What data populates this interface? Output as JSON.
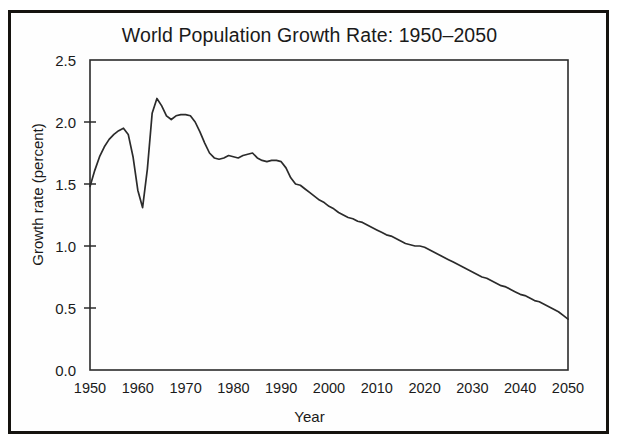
{
  "figure": {
    "title": "World Population Growth Rate: 1950–2050",
    "x_axis_title": "Year",
    "y_axis_title": "Growth rate (percent)",
    "frame_color": "#15130f",
    "line_color": "#2b2b2b",
    "background_color": "#ffffff"
  },
  "chart_data": {
    "type": "line",
    "title": "World Population Growth Rate: 1950–2050",
    "xlabel": "Year",
    "ylabel": "Growth rate (percent)",
    "xlim": [
      1950,
      2050
    ],
    "ylim": [
      0.0,
      2.5
    ],
    "grid": false,
    "legend": "none",
    "xticks": [
      1950,
      1960,
      1970,
      1980,
      1990,
      2000,
      2010,
      2020,
      2030,
      2040,
      2050
    ],
    "xtick_labels": [
      "1950",
      "1960",
      "1970",
      "1980",
      "1990",
      "2000",
      "2010",
      "2020",
      "2030",
      "2040",
      "2050"
    ],
    "yticks": [
      0.0,
      0.5,
      1.0,
      1.5,
      2.0,
      2.5
    ],
    "ytick_labels": [
      "0.0",
      "0.5",
      "1.0",
      "1.5",
      "2.0",
      "2.5"
    ],
    "series": [
      {
        "name": "World population growth rate",
        "x": [
          1950,
          1951,
          1952,
          1953,
          1954,
          1955,
          1956,
          1957,
          1958,
          1959,
          1960,
          1961,
          1962,
          1963,
          1964,
          1965,
          1966,
          1967,
          1968,
          1969,
          1970,
          1971,
          1972,
          1973,
          1974,
          1975,
          1976,
          1977,
          1978,
          1979,
          1980,
          1981,
          1982,
          1983,
          1984,
          1985,
          1986,
          1987,
          1988,
          1989,
          1990,
          1991,
          1992,
          1993,
          1994,
          1995,
          1996,
          1997,
          1998,
          1999,
          2000,
          2001,
          2002,
          2003,
          2004,
          2005,
          2006,
          2007,
          2008,
          2009,
          2010,
          2011,
          2012,
          2013,
          2014,
          2015,
          2016,
          2017,
          2018,
          2019,
          2020,
          2021,
          2022,
          2023,
          2024,
          2025,
          2026,
          2027,
          2028,
          2029,
          2030,
          2031,
          2032,
          2033,
          2034,
          2035,
          2036,
          2037,
          2038,
          2039,
          2040,
          2041,
          2042,
          2043,
          2044,
          2045,
          2046,
          2047,
          2048,
          2049,
          2050
        ],
        "y": [
          1.48,
          1.61,
          1.72,
          1.8,
          1.86,
          1.9,
          1.93,
          1.95,
          1.9,
          1.72,
          1.45,
          1.31,
          1.62,
          2.07,
          2.19,
          2.13,
          2.05,
          2.02,
          2.05,
          2.06,
          2.06,
          2.05,
          2.0,
          1.92,
          1.83,
          1.75,
          1.71,
          1.7,
          1.71,
          1.73,
          1.72,
          1.71,
          1.73,
          1.74,
          1.75,
          1.71,
          1.69,
          1.68,
          1.69,
          1.69,
          1.68,
          1.63,
          1.55,
          1.5,
          1.49,
          1.46,
          1.43,
          1.4,
          1.37,
          1.35,
          1.32,
          1.3,
          1.27,
          1.25,
          1.23,
          1.22,
          1.2,
          1.19,
          1.17,
          1.15,
          1.13,
          1.11,
          1.09,
          1.08,
          1.06,
          1.04,
          1.02,
          1.01,
          1.0,
          1.0,
          0.99,
          0.97,
          0.95,
          0.93,
          0.91,
          0.89,
          0.87,
          0.85,
          0.83,
          0.81,
          0.79,
          0.77,
          0.75,
          0.74,
          0.72,
          0.7,
          0.68,
          0.67,
          0.65,
          0.63,
          0.61,
          0.6,
          0.58,
          0.56,
          0.55,
          0.53,
          0.51,
          0.49,
          0.47,
          0.44,
          0.41
        ]
      }
    ],
    "annotations": {
      "peak_value": 2.19,
      "peak_year": 1964,
      "famine_dip_value": 1.31,
      "famine_dip_year": 1961,
      "start_value": 1.48,
      "end_value": 0.41
    }
  }
}
